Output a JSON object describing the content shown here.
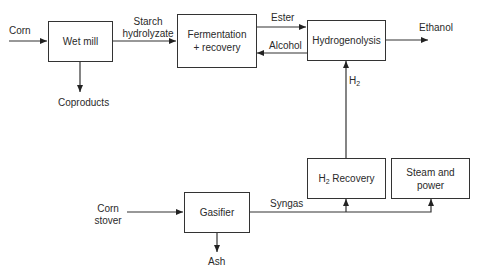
{
  "diagram": {
    "type": "process-flow",
    "nodes": {
      "wet_mill": "Wet mill",
      "fermentation_line1": "Fermentation",
      "fermentation_line2": "+ recovery",
      "hydrogenolysis": "Hydrogenolysis",
      "h2_recovery_prefix": "H",
      "h2_recovery_sub": "2",
      "h2_recovery_suffix": " Recovery",
      "steam_line1": "Steam and",
      "steam_line2": "power",
      "gasifier": "Gasifier"
    },
    "edges": {
      "corn": "Corn",
      "starch_line1": "Starch",
      "starch_line2": "hydrolyzate",
      "coproducts": "Coproducts",
      "ester": "Ester",
      "alcohol": "Alcohol",
      "ethanol": "Ethanol",
      "h2_prefix": "H",
      "h2_sub": "2",
      "corn_stover_line1": "Corn",
      "corn_stover_line2": "stover",
      "syngas": "Syngas",
      "ash": "Ash"
    }
  }
}
